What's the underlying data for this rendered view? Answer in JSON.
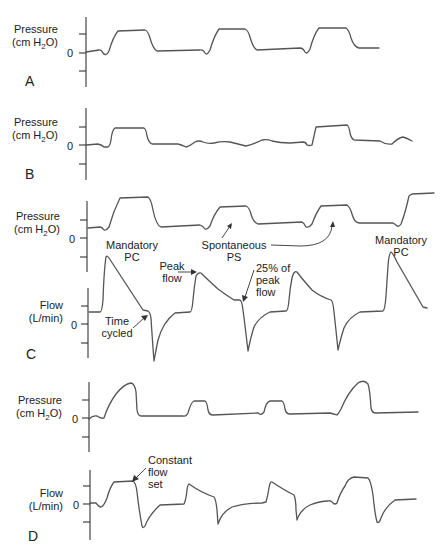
{
  "figure": {
    "panels": [
      {
        "id": "A",
        "label": "A",
        "plots": [
          {
            "ylabel_line1": "Pressure",
            "ylabel_line2_pre": "(cm H",
            "ylabel_sub": "2",
            "ylabel_line2_post": "O)",
            "zero_label": "0"
          }
        ]
      },
      {
        "id": "B",
        "label": "B",
        "plots": [
          {
            "ylabel_line1": "Pressure",
            "ylabel_line2_pre": "(cm H",
            "ylabel_sub": "2",
            "ylabel_line2_post": "O)",
            "zero_label": "0"
          }
        ]
      },
      {
        "id": "C",
        "label": "C",
        "plots": [
          {
            "ylabel_line1": "Pressure",
            "ylabel_line2_pre": "(cm H",
            "ylabel_sub": "2",
            "ylabel_line2_post": "O)",
            "zero_label": "0"
          },
          {
            "ylabel_line1": "Flow",
            "ylabel_line2": "(L/min)",
            "zero_label": "0"
          }
        ],
        "annotations": {
          "mandatory_pc_left_1": "Mandatory",
          "mandatory_pc_left_2": "PC",
          "spontaneous_1": "Spontaneous",
          "spontaneous_2": "PS",
          "mandatory_pc_right_1": "Mandatory",
          "mandatory_pc_right_2": "PC",
          "peak_flow_1": "Peak",
          "peak_flow_2": "flow",
          "pct_peak_1": "25% of",
          "pct_peak_2": "peak",
          "pct_peak_3": "flow",
          "time_cycled_1": "Time",
          "time_cycled_2": "cycled"
        }
      },
      {
        "id": "D",
        "label": "D",
        "plots": [
          {
            "ylabel_line1": "Pressure",
            "ylabel_line2_pre": "(cm H",
            "ylabel_sub": "2",
            "ylabel_line2_post": "O)",
            "zero_label": "0"
          },
          {
            "ylabel_line1": "Flow",
            "ylabel_line2": "(L/min)",
            "zero_label": "0"
          }
        ],
        "annotations": {
          "constant_1": "Constant",
          "constant_2": "flow",
          "constant_3": "set"
        }
      }
    ]
  },
  "colors": {
    "waveform": "#555555",
    "axis": "#333333",
    "text": "#222222",
    "background": "#ffffff"
  }
}
